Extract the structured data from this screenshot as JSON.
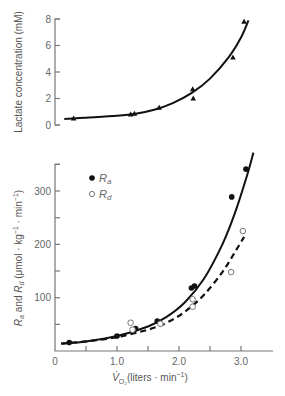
{
  "chart_data": [
    {
      "type": "scatter",
      "title": "",
      "xlabel": "",
      "ylabel": "Lactate concentration (mM)",
      "xlim": [
        0,
        3.5
      ],
      "ylim": [
        0,
        8
      ],
      "yticks": [
        0,
        2,
        4,
        6,
        8
      ],
      "grid": false,
      "series": [
        {
          "name": "Lactate",
          "marker": "triangle",
          "x": [
            0.3,
            1.22,
            1.28,
            1.68,
            2.22,
            2.23,
            2.87,
            3.05
          ],
          "y": [
            0.5,
            0.8,
            0.85,
            1.3,
            2.7,
            2.0,
            5.1,
            7.8
          ]
        }
      ],
      "fit_curve": {
        "name": "Lactate fit",
        "style": "solid",
        "x": [
          0.15,
          0.5,
          1.0,
          1.3,
          1.6,
          1.9,
          2.2,
          2.5,
          2.8,
          3.0,
          3.12
        ],
        "y": [
          0.45,
          0.55,
          0.7,
          0.85,
          1.15,
          1.65,
          2.4,
          3.5,
          5.1,
          6.6,
          7.9
        ]
      }
    },
    {
      "type": "scatter",
      "title": "",
      "xlabel": "V̇O₂ (liters · min⁻¹)",
      "ylabel": "Ra and Rd (μmol · kg⁻¹ · min⁻¹)",
      "xlim": [
        0,
        3.5
      ],
      "ylim": [
        0,
        350
      ],
      "xticks": [
        0,
        0.5,
        1.0,
        1.5,
        2.0,
        2.5,
        3.0
      ],
      "xtick_labels": [
        "0",
        "",
        "1.0",
        "",
        "2.0",
        "",
        "3.0"
      ],
      "yticks": [
        50,
        100,
        150,
        200,
        250,
        300,
        350
      ],
      "ytick_labels": [
        "",
        "100",
        "",
        "200",
        "",
        "300",
        ""
      ],
      "legend": {
        "position": "upper left",
        "entries": [
          "Ra",
          "Rd"
        ]
      },
      "grid": false,
      "series": [
        {
          "name": "Ra",
          "marker": "filled-circle",
          "x": [
            0.23,
            1.0,
            1.3,
            1.65,
            2.2,
            2.25,
            2.85,
            3.08
          ],
          "y": [
            16,
            28,
            42,
            56,
            118,
            122,
            289,
            341
          ]
        },
        {
          "name": "Rd",
          "marker": "open-circle",
          "x": [
            1.22,
            1.25,
            1.7,
            2.22,
            2.22,
            2.84,
            3.03
          ],
          "y": [
            53,
            40,
            51,
            97,
            83,
            148,
            225
          ]
        }
      ],
      "fit_curves": [
        {
          "name": "Ra fit",
          "style": "solid",
          "x": [
            0.1,
            0.5,
            1.0,
            1.5,
            1.8,
            2.1,
            2.4,
            2.7,
            2.9,
            3.1,
            3.2
          ],
          "y": [
            14,
            18,
            28,
            46,
            64,
            92,
            135,
            200,
            258,
            330,
            372
          ]
        },
        {
          "name": "Rd fit",
          "style": "dashed",
          "x": [
            0.1,
            0.5,
            1.0,
            1.5,
            1.8,
            2.1,
            2.4,
            2.7,
            2.9,
            3.05
          ],
          "y": [
            14,
            18,
            26,
            40,
            53,
            74,
            105,
            148,
            185,
            214
          ]
        }
      ]
    }
  ],
  "labels": {
    "top_ylabel": "Lactate concentration (mM)",
    "bottom_ylabel_parts": [
      "R",
      "a",
      " and ",
      "R",
      "d",
      " (μmol · kg",
      "−1",
      " · min",
      "−1",
      ")"
    ],
    "xlabel_parts": [
      "V̇",
      "O₂",
      "(liters · min",
      "−1",
      ")"
    ],
    "legend_ra": [
      "R",
      "a"
    ],
    "legend_rd": [
      "R",
      "d"
    ]
  }
}
